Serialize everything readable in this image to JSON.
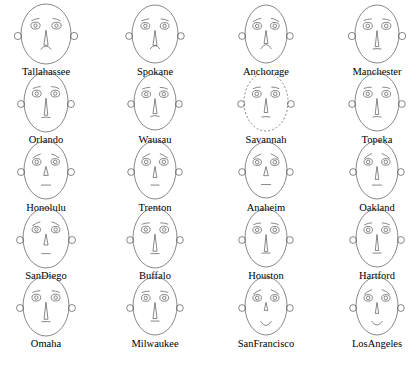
{
  "chart_data": {
    "type": "chernoff-faces",
    "title": "",
    "subtitle": "",
    "xlabel": "",
    "ylabel": "",
    "grid": false,
    "legend_position": "none",
    "layout": {
      "columns": 4,
      "rows": 5,
      "count": 20
    },
    "stroke_color": "#555555",
    "background_color": "#ffffff",
    "feature_names": [
      "face-width",
      "face-height",
      "ear-size",
      "eye-size",
      "eyebrow-slant",
      "nose-length",
      "mouth-curvature",
      "mouth-width"
    ],
    "categories": [
      "Tallahassee",
      "Spokane",
      "Anchorage",
      "Manchester",
      "Orlando",
      "Wausau",
      "Savannah",
      "Topeka",
      "Honolulu",
      "Trenton",
      "Anaheim",
      "Oakland",
      "SanDiego",
      "Buffalo",
      "Houston",
      "Hartford",
      "Omaha",
      "Milwaukee",
      "SanFrancisco",
      "LosAngeles"
    ],
    "faces": [
      {
        "label": "Tallahassee",
        "face_rx": 25,
        "face_ry": 30,
        "ear_r": 3.6,
        "eye_rx": 4.6,
        "eye_ry": 3.4,
        "pupil_r": 1.7,
        "brow_slant": -7,
        "brow_len": 8,
        "nose_len": 15,
        "nose_w": 4.2,
        "mouth_curve": -3.5,
        "mouth_w": 11,
        "top_dashed": false
      },
      {
        "label": "Spokane",
        "face_rx": 23,
        "face_ry": 29,
        "ear_r": 3.4,
        "eye_rx": 4.4,
        "eye_ry": 3.3,
        "pupil_r": 1.7,
        "brow_slant": -6,
        "brow_len": 8,
        "nose_len": 15,
        "nose_w": 4.0,
        "mouth_curve": -3.5,
        "mouth_w": 10,
        "top_dashed": false
      },
      {
        "label": "Anchorage",
        "face_rx": 21,
        "face_ry": 29,
        "ear_r": 3.4,
        "eye_rx": 4.3,
        "eye_ry": 3.4,
        "pupil_r": 1.8,
        "brow_slant": -10,
        "brow_len": 8,
        "nose_len": 13,
        "nose_w": 3.8,
        "mouth_curve": -4.5,
        "mouth_w": 11,
        "top_dashed": false
      },
      {
        "label": "Manchester",
        "face_rx": 22,
        "face_ry": 29,
        "ear_r": 3.6,
        "eye_rx": 4.6,
        "eye_ry": 3.5,
        "pupil_r": 1.8,
        "brow_slant": -5,
        "brow_len": 8,
        "nose_len": 16,
        "nose_w": 3.6,
        "mouth_curve": -0.5,
        "mouth_w": 9,
        "top_dashed": false
      },
      {
        "label": "Orlando",
        "face_rx": 22,
        "face_ry": 30,
        "ear_r": 3.5,
        "eye_rx": 4.4,
        "eye_ry": 3.4,
        "pupil_r": 1.7,
        "brow_slant": -6,
        "brow_len": 8,
        "nose_len": 17,
        "nose_w": 3.6,
        "mouth_curve": -0.5,
        "mouth_w": 9,
        "top_dashed": false
      },
      {
        "label": "Wausau",
        "face_rx": 21,
        "face_ry": 28,
        "ear_r": 3.4,
        "eye_rx": 4.3,
        "eye_ry": 3.3,
        "pupil_r": 1.7,
        "brow_slant": -5,
        "brow_len": 8,
        "nose_len": 15,
        "nose_w": 4.0,
        "mouth_curve": -1.0,
        "mouth_w": 9,
        "top_dashed": false
      },
      {
        "label": "Savannah",
        "face_rx": 22,
        "face_ry": 29,
        "ear_r": 3.4,
        "eye_rx": 4.4,
        "eye_ry": 3.4,
        "pupil_r": 1.8,
        "brow_slant": -5,
        "brow_len": 8,
        "nose_len": 14,
        "nose_w": 3.8,
        "mouth_curve": -0.5,
        "mouth_w": 9,
        "top_dashed": true
      },
      {
        "label": "Topeka",
        "face_rx": 22,
        "face_ry": 29,
        "ear_r": 3.4,
        "eye_rx": 4.4,
        "eye_ry": 3.4,
        "pupil_r": 1.7,
        "brow_slant": -4,
        "brow_len": 8,
        "nose_len": 16,
        "nose_w": 3.6,
        "mouth_curve": -0.5,
        "mouth_w": 9,
        "top_dashed": false
      },
      {
        "label": "Honolulu",
        "face_rx": 22,
        "face_ry": 29,
        "ear_r": 3.5,
        "eye_rx": 4.2,
        "eye_ry": 3.3,
        "pupil_r": 1.8,
        "brow_slant": -12,
        "brow_len": 8,
        "nose_len": 9,
        "nose_w": 4.6,
        "mouth_curve": 0,
        "mouth_w": 10,
        "top_dashed": false
      },
      {
        "label": "Trenton",
        "face_rx": 21,
        "face_ry": 29,
        "ear_r": 3.4,
        "eye_rx": 4.3,
        "eye_ry": 3.4,
        "pupil_r": 1.8,
        "brow_slant": -13,
        "brow_len": 8,
        "nose_len": 11,
        "nose_w": 3.8,
        "mouth_curve": 0,
        "mouth_w": 9,
        "top_dashed": false
      },
      {
        "label": "Anaheim",
        "face_rx": 21,
        "face_ry": 28,
        "ear_r": 3.4,
        "eye_rx": 4.2,
        "eye_ry": 3.3,
        "pupil_r": 1.8,
        "brow_slant": -14,
        "brow_len": 8,
        "nose_len": 9,
        "nose_w": 4.6,
        "mouth_curve": 0,
        "mouth_w": 10,
        "top_dashed": false
      },
      {
        "label": "Oakland",
        "face_rx": 21,
        "face_ry": 29,
        "ear_r": 3.4,
        "eye_rx": 4.2,
        "eye_ry": 3.3,
        "pupil_r": 1.8,
        "brow_slant": -15,
        "brow_len": 8,
        "nose_len": 13,
        "nose_w": 3.6,
        "mouth_curve": 0,
        "mouth_w": 10,
        "top_dashed": false
      },
      {
        "label": "SanDiego",
        "face_rx": 23,
        "face_ry": 30,
        "ear_r": 3.5,
        "eye_rx": 4.2,
        "eye_ry": 3.2,
        "pupil_r": 1.7,
        "brow_slant": -12,
        "brow_len": 8,
        "nose_len": 11,
        "nose_w": 4.2,
        "mouth_curve": 0,
        "mouth_w": 9,
        "top_dashed": false
      },
      {
        "label": "Buffalo",
        "face_rx": 22,
        "face_ry": 30,
        "ear_r": 3.4,
        "eye_rx": 4.4,
        "eye_ry": 3.4,
        "pupil_r": 1.7,
        "brow_slant": -4,
        "brow_len": 8,
        "nose_len": 17,
        "nose_w": 4.2,
        "mouth_curve": 0,
        "mouth_w": 9,
        "top_dashed": false
      },
      {
        "label": "Houston",
        "face_rx": 21,
        "face_ry": 29,
        "ear_r": 3.4,
        "eye_rx": 4.3,
        "eye_ry": 3.4,
        "pupil_r": 1.8,
        "brow_slant": -5,
        "brow_len": 8,
        "nose_len": 17,
        "nose_w": 3.4,
        "mouth_curve": 0,
        "mouth_w": 9,
        "top_dashed": false
      },
      {
        "label": "Hartford",
        "face_rx": 21,
        "face_ry": 29,
        "ear_r": 3.4,
        "eye_rx": 4.3,
        "eye_ry": 3.4,
        "pupil_r": 1.8,
        "brow_slant": -6,
        "brow_len": 8,
        "nose_len": 16,
        "nose_w": 3.4,
        "mouth_curve": 0,
        "mouth_w": 9,
        "top_dashed": false
      },
      {
        "label": "Omaha",
        "face_rx": 23,
        "face_ry": 30,
        "ear_r": 3.5,
        "eye_rx": 4.4,
        "eye_ry": 3.4,
        "pupil_r": 1.7,
        "brow_slant": -5,
        "brow_len": 8,
        "nose_len": 17,
        "nose_w": 4.0,
        "mouth_curve": 0,
        "mouth_w": 9,
        "top_dashed": false
      },
      {
        "label": "Milwaukee",
        "face_rx": 22,
        "face_ry": 29,
        "ear_r": 3.4,
        "eye_rx": 4.4,
        "eye_ry": 3.4,
        "pupil_r": 1.7,
        "brow_slant": -4,
        "brow_len": 8,
        "nose_len": 16,
        "nose_w": 4.0,
        "mouth_curve": 0,
        "mouth_w": 9,
        "top_dashed": false
      },
      {
        "label": "SanFrancisco",
        "face_rx": 21,
        "face_ry": 29,
        "ear_r": 3.4,
        "eye_rx": 4.2,
        "eye_ry": 3.3,
        "pupil_r": 1.8,
        "brow_slant": -13,
        "brow_len": 8,
        "nose_len": 8,
        "nose_w": 3.6,
        "mouth_curve": 4.5,
        "mouth_w": 11,
        "top_dashed": false
      },
      {
        "label": "LosAngeles",
        "face_rx": 21,
        "face_ry": 29,
        "ear_r": 3.4,
        "eye_rx": 4.2,
        "eye_ry": 3.3,
        "pupil_r": 1.8,
        "brow_slant": -14,
        "brow_len": 8,
        "nose_len": 11,
        "nose_w": 3.4,
        "mouth_curve": 4.0,
        "mouth_w": 11,
        "top_dashed": false
      }
    ]
  }
}
